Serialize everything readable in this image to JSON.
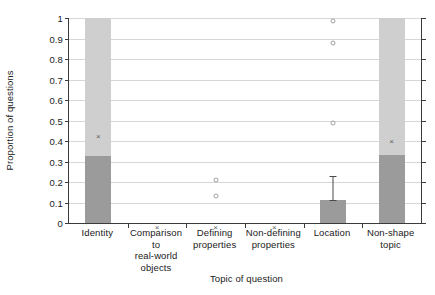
{
  "chart_data": {
    "type": "bar",
    "title": "",
    "xlabel": "Topic of question",
    "ylabel": "Proportion of questions",
    "ylim": [
      0,
      1
    ],
    "ytick_labels": [
      "0",
      "0.1",
      "0.2",
      "0.3",
      "0.4",
      "0.5",
      "0.6",
      "0.7",
      "0.8",
      "0.9",
      "1"
    ],
    "ytick_values": [
      0,
      0.1,
      0.2,
      0.3,
      0.4,
      0.5,
      0.6,
      0.7,
      0.8,
      0.9,
      1
    ],
    "grid": true,
    "legend": "none",
    "categories": [
      "Identity",
      "Comparison to real-world objects",
      "Defining properties",
      "Non-defining properties",
      "Location",
      "Non-shape topic"
    ],
    "category_lines": [
      [
        "Identity"
      ],
      [
        "Comparison to",
        "real-world",
        "objects"
      ],
      [
        "Defining",
        "properties"
      ],
      [
        "Non-defining",
        "properties"
      ],
      [
        "Location"
      ],
      [
        "Non-shape",
        "topic"
      ]
    ],
    "series": [
      {
        "name": "Lower (dark) segment",
        "color": "#9b9b9b",
        "values": [
          0.325,
          0,
          0,
          0,
          0.112,
          0.33
        ]
      },
      {
        "name": "Upper (light) segment",
        "color": "#cfcfcf",
        "values": [
          0.675,
          0,
          0,
          0,
          0,
          0.67
        ]
      }
    ],
    "bar_totals": [
      1,
      0,
      0,
      0,
      0.112,
      1
    ],
    "error_bars": [
      {
        "category": "Location",
        "value": 0.112,
        "upper": 0.23,
        "lower": 0.112
      }
    ],
    "x_markers": [
      {
        "category": "Identity",
        "value": 0.44
      },
      {
        "category": "Comparison to real-world objects",
        "value": 0
      },
      {
        "category": "Defining properties",
        "value": 0
      },
      {
        "category": "Non-defining properties",
        "value": 0
      },
      {
        "category": "Non-shape topic",
        "value": 0.415
      }
    ],
    "circle_markers": [
      {
        "category": "Defining properties",
        "value": 0.22
      },
      {
        "category": "Defining properties",
        "value": 0.145
      },
      {
        "category": "Location",
        "value": 1.0
      },
      {
        "category": "Location",
        "value": 0.89
      },
      {
        "category": "Location",
        "value": 0.5
      }
    ],
    "colors": {
      "dark_segment": "#9b9b9b",
      "light_segment": "#cfcfcf",
      "gridline": "#d7d7d7",
      "axis": "#3b3b3b",
      "marker": "#5a5a5a",
      "background": "#ffffff"
    }
  }
}
